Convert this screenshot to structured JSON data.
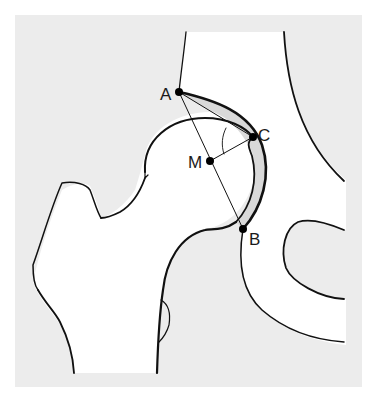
{
  "figure": {
    "colors": {
      "background": "#ffffff",
      "panel": "#ececec",
      "bone": "#ffffff",
      "cartilage": "#d9d9d9",
      "line": "#111111"
    }
  },
  "points": [
    {
      "id": "A",
      "label": "A",
      "x": 179,
      "y": 92
    },
    {
      "id": "C",
      "label": "C",
      "x": 253,
      "y": 137
    },
    {
      "id": "M",
      "label": "M",
      "x": 210,
      "y": 161
    },
    {
      "id": "B",
      "label": "B",
      "x": 243,
      "y": 229
    }
  ],
  "segments": [
    {
      "from": "A",
      "to": "B",
      "name": "line-AB"
    },
    {
      "from": "A",
      "to": "C",
      "name": "line-AC"
    },
    {
      "from": "M",
      "to": "C",
      "name": "line-MC"
    }
  ],
  "structures": [
    "femoral-head",
    "femoral-neck",
    "greater-trochanter",
    "acetabulum-roof",
    "ilium",
    "pubis",
    "obturator-foramen",
    "acetabular-cartilage"
  ]
}
